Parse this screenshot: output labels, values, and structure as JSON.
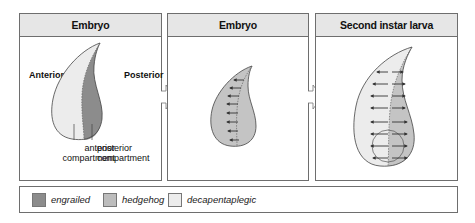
{
  "panels": [
    {
      "title": "Embryo",
      "labels": {
        "anterior": "Anterior",
        "posterior": "Posterior",
        "anterior_compartment": "anterior compartment",
        "posterior_compartment": "posterior compartment"
      }
    },
    {
      "title": "Embryo"
    },
    {
      "title": "Second instar larva"
    }
  ],
  "legend": [
    {
      "label": "engrailed",
      "color": "#8c8c8c"
    },
    {
      "label": "hedgehog",
      "color": "#bdbdbd"
    },
    {
      "label": "decapentaplegic",
      "color": "#ececec"
    }
  ],
  "colors": {
    "border": "#6e6e6e",
    "header_bg": "#e6e6e6",
    "arrow": "#333333"
  }
}
